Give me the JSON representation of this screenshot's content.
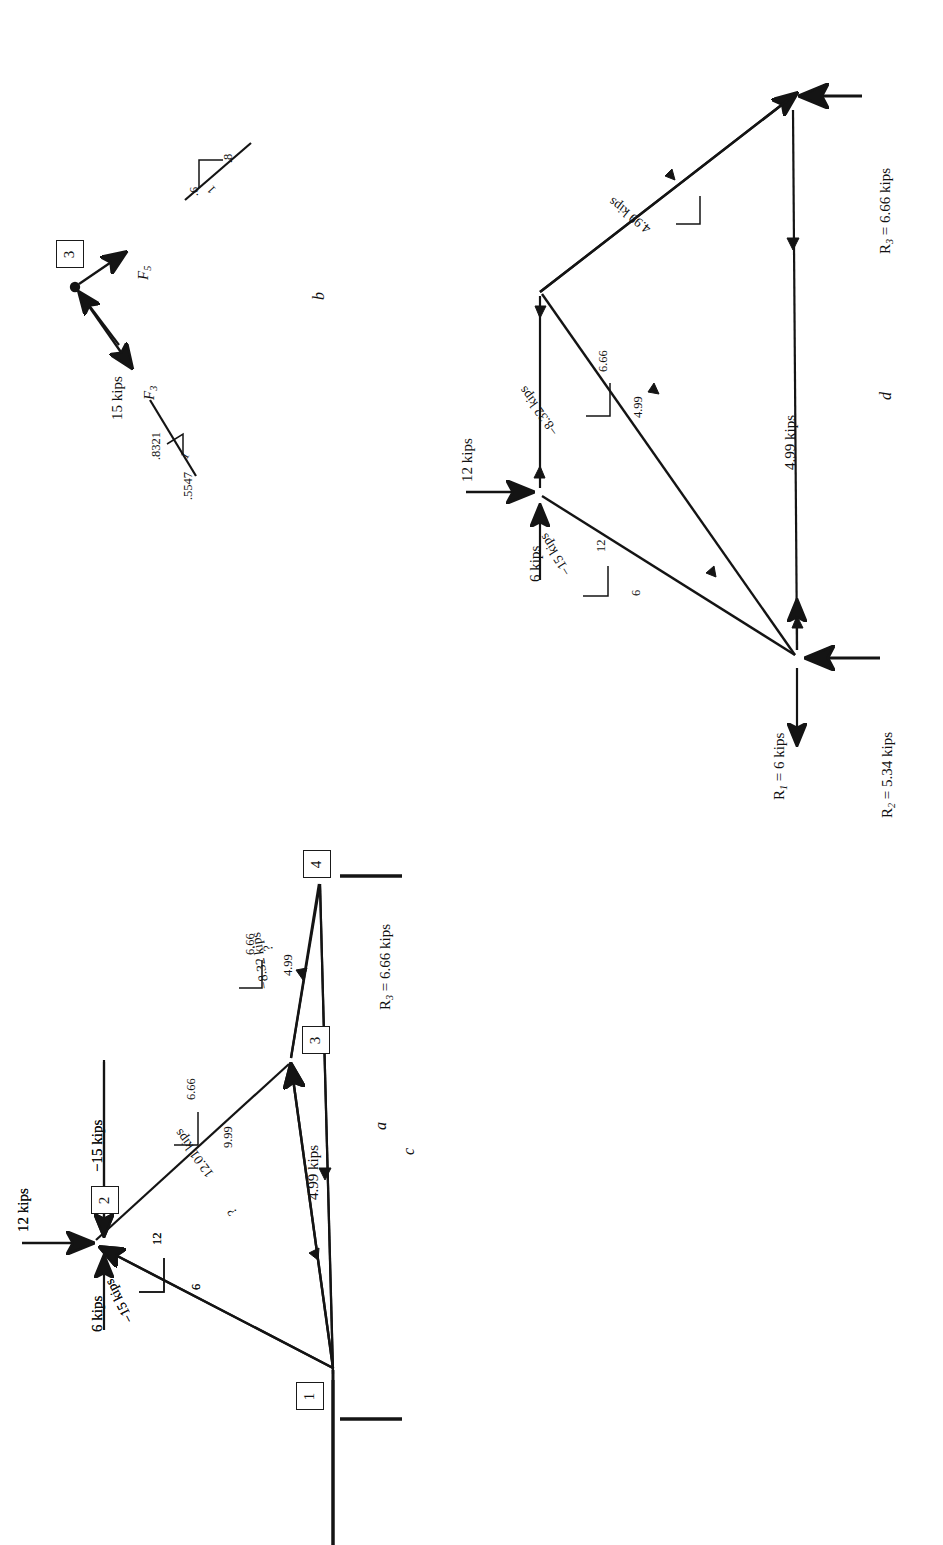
{
  "figure": {
    "caption_letters": {
      "a": "a",
      "b": "b",
      "c": "c",
      "d": "d"
    },
    "orientation_note": "rotated-90"
  },
  "panel_a": {
    "letter": "a",
    "nodes": [
      {
        "id": "1",
        "label": "1"
      },
      {
        "id": "2",
        "label": "2"
      },
      {
        "id": "3",
        "label": "3"
      },
      {
        "id": "4",
        "label": "4"
      }
    ],
    "loads": [
      {
        "name": "load-12-kips",
        "label": "12 kips"
      },
      {
        "name": "load-6-kips",
        "label": "6 kips"
      }
    ],
    "members": [
      {
        "name": "member-1-2",
        "label": "−15 kips",
        "rise": "12",
        "run": "6"
      },
      {
        "name": "member-2-3",
        "label": "−15 kips"
      },
      {
        "name": "member-1-3",
        "label": "?"
      },
      {
        "name": "member-3-4",
        "label": "?"
      }
    ]
  },
  "panel_b": {
    "letter": "b",
    "node": "3",
    "applied_load": "15 kips",
    "forces": [
      {
        "name": "force-F5",
        "label": "F",
        "sub": "5"
      },
      {
        "name": "force-F3",
        "label": "F",
        "sub": "3"
      }
    ],
    "slope_upper": {
      "rise": ".6",
      "run": ".8",
      "hyp": "1"
    },
    "slope_lower": {
      "rise": ".8321",
      "run": ".5547",
      "hyp": "1"
    }
  },
  "panel_c": {
    "letter": "c",
    "nodes": [
      {
        "id": "1",
        "label": "1"
      },
      {
        "id": "2",
        "label": "2"
      },
      {
        "id": "3",
        "label": "3"
      },
      {
        "id": "4",
        "label": "4"
      }
    ],
    "loads": [
      {
        "name": "load-12-kips",
        "label": "12 kips"
      },
      {
        "name": "load-6-kips",
        "label": "6 kips"
      }
    ],
    "members": [
      {
        "name": "member-1-2",
        "label": "−15 kips",
        "rise": "12",
        "run": "6"
      },
      {
        "name": "member-2-3",
        "label": "−15 kips"
      },
      {
        "name": "member-1-3",
        "label": "12.01 kips",
        "rise": "6.66",
        "run": "9.99"
      },
      {
        "name": "member-3-4",
        "label": "−8.32 kips",
        "rise": "6.66",
        "run": "4.99"
      },
      {
        "name": "member-1-4",
        "label": "4.99 kips"
      }
    ],
    "reactions": [
      {
        "name": "reaction-R3",
        "label": "R",
        "sub": "3",
        "value": " = 6.66 kips"
      }
    ]
  },
  "panel_d": {
    "letter": "d",
    "loads": [
      {
        "name": "load-12-kips",
        "label": "12 kips"
      },
      {
        "name": "load-6-kips",
        "label": "6 kips"
      }
    ],
    "members": [
      {
        "name": "member-1-2",
        "label": "−15 kips",
        "rise": "12",
        "run": "6"
      },
      {
        "name": "member-1-3",
        "label": "12.01 kips",
        "rise": "6.66",
        "run": "9.99"
      },
      {
        "name": "member-3-4",
        "label": "−8.32 kips",
        "rise": "6.66",
        "run": "4.99"
      },
      {
        "name": "member-1-4",
        "label": "4.99 kips"
      }
    ],
    "reactions": [
      {
        "name": "reaction-R1",
        "label": "R",
        "sub": "1",
        "value": " = 6 kips"
      },
      {
        "name": "reaction-R2",
        "label": "R",
        "sub": "2",
        "value": " = 5.34 kips"
      },
      {
        "name": "reaction-R3",
        "label": "R",
        "sub": "3",
        "value": " = 6.66 kips"
      }
    ]
  }
}
